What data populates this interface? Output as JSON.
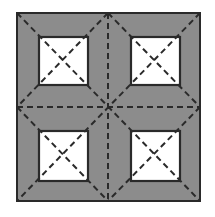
{
  "diagram": {
    "type": "square fold pattern",
    "colors": {
      "background": "#ffffff",
      "fill": "#8c8c8c",
      "window": "#ffffff",
      "line": "#2a2a2a"
    },
    "outer": {
      "x": 17,
      "y": 13,
      "size": 183
    },
    "windows": [
      {
        "x": 39,
        "y": 37,
        "size": 48
      },
      {
        "x": 131,
        "y": 37,
        "size": 48
      },
      {
        "x": 39,
        "y": 131,
        "size": 48
      },
      {
        "x": 131,
        "y": 131,
        "size": 48
      }
    ]
  }
}
